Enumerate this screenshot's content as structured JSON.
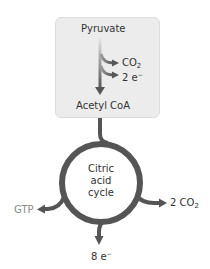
{
  "diagram": {
    "box": {
      "input": "Pyruvate",
      "output": "Acetyl CoA",
      "byproducts": [
        {
          "base": "CO",
          "sub": "2",
          "sup": ""
        },
        {
          "base": "2 e",
          "sub": "",
          "sup": "−"
        }
      ]
    },
    "cycle": {
      "line1": "Citric",
      "line2": "acid",
      "line3": "cycle"
    },
    "outputs": {
      "right": {
        "base": "2 CO",
        "sub": "2"
      },
      "left": {
        "label": "GTP"
      },
      "bottom": {
        "base": "8 e",
        "sup": "−"
      }
    },
    "colors": {
      "stroke": "#555555",
      "box_fill": "#ececec",
      "gtp_text": "#8a8a8a",
      "text": "#333333"
    }
  }
}
